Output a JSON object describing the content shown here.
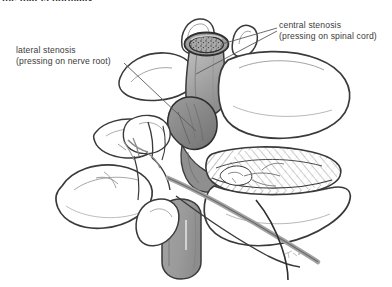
{
  "figure": {
    "title_clipped": "the that is normally",
    "background_color": "#ffffff",
    "width": 392,
    "height": 287
  },
  "annotations": [
    {
      "id": "lateral",
      "line1": "lateral stenosis",
      "line2": "(pressing on nerve root)",
      "leader_count": 1
    },
    {
      "id": "central",
      "line1": "central stenosis",
      "line2": "(pressing on spinal cord)",
      "leader_count": 2
    }
  ],
  "palette": {
    "ink": "#3a3a3a",
    "ink_dark": "#222222",
    "cord_light": "#b9b9b9",
    "cord_mid": "#a0a0a0",
    "cord_dark": "#8a8a8a",
    "cord_rim": "#6e6e6e",
    "hatch": "#6d6d6d",
    "nerve": "#9a9a9a",
    "bone_fill": "#ffffff",
    "leader": "#5a5a5a"
  },
  "structures": [
    {
      "name": "spinal-cord-cross-section",
      "shading": "speckled-rim"
    },
    {
      "name": "superior-articular-process",
      "shading": "outline"
    },
    {
      "name": "stenotic-compression-mass",
      "shading": "dark-gray"
    },
    {
      "name": "intervertebral-disc-annulus",
      "shading": "hatched"
    },
    {
      "name": "vertebral-body",
      "shading": "outline"
    },
    {
      "name": "spinous-process",
      "shading": "outline"
    },
    {
      "name": "transverse-process",
      "shading": "outline"
    },
    {
      "name": "nerve-root-branches",
      "shading": "gray-line"
    },
    {
      "name": "thecal-sac-lower",
      "shading": "mid-gray"
    },
    {
      "name": "artist-signature",
      "shading": "faint"
    }
  ]
}
